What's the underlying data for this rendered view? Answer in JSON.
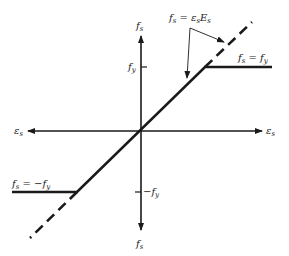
{
  "diagram": {
    "axes": {
      "vertical_top_label": "f",
      "vertical_top_sub": "s",
      "vertical_bottom_label": "f",
      "vertical_bottom_sub": "s",
      "horizontal_left_label": "ε",
      "horizontal_left_sub": "s",
      "horizontal_right_label": "ε",
      "horizontal_right_sub": "s"
    },
    "ticks": {
      "positive_yield": {
        "label": "f",
        "sub": "y"
      },
      "negative_yield": {
        "prefix": "−f",
        "sub": "y"
      }
    },
    "annotations": {
      "elastic_eq": {
        "f": "f",
        "f_sub": "s",
        "eq": " = ",
        "eps": "ε",
        "eps_sub": "s",
        "E": "E",
        "E_sub": "s"
      },
      "yield_pos": {
        "f": "f",
        "f_sub": "s",
        "eq": " = ",
        "rhs": "f",
        "rhs_sub": "y"
      },
      "yield_neg": {
        "f": "f",
        "f_sub": "s",
        "eq": " = ",
        "rhs": "−f",
        "rhs_sub": "y"
      }
    },
    "colors": {
      "line": "#1a1a1a",
      "background": "#ffffff"
    }
  }
}
